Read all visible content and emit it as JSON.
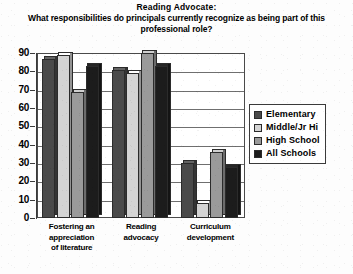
{
  "chart_data": {
    "type": "bar",
    "title": "Reading Advocate:",
    "subtitle": "What responsibilities do principals currently recognize as being part of this professional role?",
    "xlabel": "",
    "ylabel": "",
    "ylim": [
      0,
      90
    ],
    "yticks": [
      90,
      80,
      70,
      60,
      50,
      40,
      30,
      20,
      10,
      0
    ],
    "grid": true,
    "legend_position": "right",
    "categories": [
      "Fostering an appreciation of literature",
      "Reading advocacy",
      "Curriculum development"
    ],
    "series": [
      {
        "name": "Elementary",
        "color": "#4a4a4a",
        "values": [
          87,
          81,
          30
        ]
      },
      {
        "name": "Middle/Jr Hi",
        "color": "#d4d4d4",
        "values": [
          89,
          79,
          8
        ]
      },
      {
        "name": "High School",
        "color": "#9a9a9a",
        "values": [
          69,
          90,
          36
        ]
      },
      {
        "name": "All Schools",
        "color": "#1c1c1c",
        "values": [
          83,
          83,
          28
        ]
      }
    ]
  },
  "category_lines": [
    [
      "Fostering an",
      "appreciation",
      "of literature"
    ],
    [
      "Reading",
      "advocacy"
    ],
    [
      "Curriculum",
      "development"
    ]
  ]
}
